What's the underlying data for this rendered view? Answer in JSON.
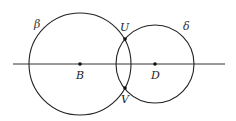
{
  "diagram": {
    "line": {
      "x1": 13,
      "y1": 64,
      "x2": 225,
      "y2": 64
    },
    "circles": [
      {
        "name": "β",
        "cx": 80,
        "cy": 64,
        "r": 51,
        "label_x": 34,
        "label_y": 28
      },
      {
        "name": "δ",
        "cx": 155,
        "cy": 64,
        "r": 39,
        "label_x": 183,
        "label_y": 30
      }
    ],
    "points": [
      {
        "name": "B",
        "x": 80,
        "y": 64,
        "label_x": 76,
        "label_y": 79
      },
      {
        "name": "D",
        "x": 155,
        "y": 64,
        "label_x": 151,
        "label_y": 79
      },
      {
        "name": "U",
        "x": 125,
        "y": 39,
        "label_x": 120,
        "label_y": 31
      },
      {
        "name": "V",
        "x": 125,
        "y": 88,
        "label_x": 121,
        "label_y": 103
      }
    ],
    "stroke_color": "#222222"
  }
}
